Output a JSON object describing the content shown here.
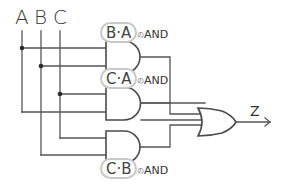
{
  "diagram": {
    "type": "logic-circuit",
    "inputs": [
      {
        "id": "A",
        "label": "A"
      },
      {
        "id": "B",
        "label": "B"
      },
      {
        "id": "C",
        "label": "C"
      }
    ],
    "gates": [
      {
        "id": "and1",
        "type": "AND",
        "term": "B·A",
        "particle": "の",
        "suffix": "AND",
        "inputs": [
          "A",
          "B"
        ]
      },
      {
        "id": "and2",
        "type": "AND",
        "term": "C·A",
        "particle": "の",
        "suffix": "AND",
        "inputs": [
          "C",
          "A"
        ]
      },
      {
        "id": "and3",
        "type": "AND",
        "term": "C·B",
        "particle": "の",
        "suffix": "AND",
        "inputs": [
          "C",
          "B"
        ]
      },
      {
        "id": "or1",
        "type": "OR",
        "inputs": [
          "and1",
          "and2",
          "and3"
        ]
      }
    ],
    "output": {
      "id": "Z",
      "label": "Z",
      "source": "or1"
    }
  }
}
